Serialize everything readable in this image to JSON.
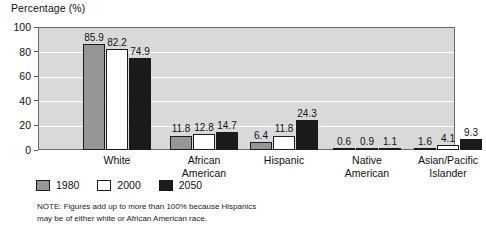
{
  "chart_data": {
    "type": "bar",
    "title": "",
    "ylabel": "Percentage (%)",
    "xlabel": "",
    "ylim": [
      0,
      100
    ],
    "yticks": [
      0,
      20,
      40,
      60,
      80,
      100
    ],
    "grid": true,
    "legend_position": "below-plot-left",
    "categories": [
      "White",
      "African American",
      "Hispanic",
      "Native American",
      "Asian/Pacific Islander"
    ],
    "category_labels": [
      "White",
      "African\nAmerican",
      "Hispanic",
      "Native\nAmerican",
      "Asian/Pacific\nIslander"
    ],
    "series": [
      {
        "name": "1980",
        "color": "#969696",
        "values": [
          85.9,
          11.8,
          6.4,
          0.6,
          1.6
        ]
      },
      {
        "name": "2000",
        "color": "#ffffff",
        "values": [
          82.2,
          12.8,
          11.8,
          0.9,
          4.1
        ]
      },
      {
        "name": "2050",
        "color": "#1b1b1b",
        "values": [
          74.9,
          14.7,
          24.3,
          1.1,
          9.3
        ]
      }
    ],
    "value_labels": [
      [
        "85.9",
        "82.2",
        "74.9"
      ],
      [
        "11.8",
        "12.8",
        "14.7"
      ],
      [
        "6.4",
        "11.8",
        "24.3"
      ],
      [
        "0.6",
        "0.9",
        "1.1"
      ],
      [
        "1.6",
        "4.1",
        "9.3"
      ]
    ],
    "annotations": [
      "NOTE: Figures add up to more than 100% because Hispanics",
      "may be of either white or African American race."
    ]
  },
  "axis": {
    "y_title": "Percentage (%)",
    "y_tick_labels": [
      "100",
      "80",
      "60",
      "40",
      "20",
      "0"
    ]
  },
  "legend": {
    "entries": [
      {
        "label": "1980"
      },
      {
        "label": "2000"
      },
      {
        "label": "2050"
      }
    ]
  },
  "note": {
    "line1": "NOTE: Figures add up to more than 100% because Hispanics",
    "line2": "may be of either white or African American race."
  },
  "colors": {
    "plot_background": "#d9d9d9",
    "gridline": "#ffffff",
    "plot_border": "#6b6b6b",
    "series_1980": "#969696",
    "series_2000": "#ffffff",
    "series_2050": "#1b1b1b",
    "text": "#111111"
  }
}
